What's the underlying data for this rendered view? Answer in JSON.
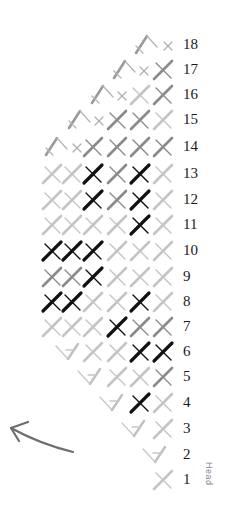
{
  "diagram": {
    "direction_arrow": "arrow-up-left",
    "side_label": "Head",
    "columns_x": [
      52,
      72,
      93,
      117,
      140,
      163
    ],
    "colors": {
      "d": "#111111",
      "m": "#8a8a8a",
      "l": "#c4c4c4",
      "x": "#b0b0b0"
    },
    "rows": [
      {
        "label": "18",
        "y": 45,
        "turn": {
          "type": "peak",
          "x": 147
        },
        "small_x": [
          168
        ],
        "cells": [
          null,
          null,
          null,
          null,
          null,
          null
        ]
      },
      {
        "label": "17",
        "y": 70,
        "turn": {
          "type": "peak",
          "x": 125
        },
        "small_x": [
          144
        ],
        "cells": [
          null,
          null,
          null,
          null,
          null,
          "m"
        ]
      },
      {
        "label": "16",
        "y": 95,
        "turn": {
          "type": "peak",
          "x": 103
        },
        "small_x": [
          122
        ],
        "cells": [
          null,
          null,
          null,
          null,
          "l",
          "m"
        ]
      },
      {
        "label": "15",
        "y": 120,
        "turn": {
          "type": "peak",
          "x": 80
        },
        "small_x": [
          99
        ],
        "cells": [
          null,
          null,
          null,
          "m",
          "m",
          "l"
        ]
      },
      {
        "label": "14",
        "y": 147,
        "turn": {
          "type": "peak",
          "x": 57
        },
        "small_x": [
          77
        ],
        "cells": [
          null,
          null,
          "m",
          "m",
          "m",
          "m"
        ]
      },
      {
        "label": "13",
        "y": 174,
        "turn": null,
        "small_x": [],
        "cells": [
          "l",
          "l",
          "d",
          "m",
          "d",
          "l"
        ]
      },
      {
        "label": "12",
        "y": 200,
        "turn": null,
        "small_x": [],
        "cells": [
          "l",
          "l",
          "d",
          "m",
          "d",
          "l"
        ]
      },
      {
        "label": "11",
        "y": 225,
        "turn": null,
        "small_x": [],
        "cells": [
          "l",
          "l",
          "l",
          "l",
          "d",
          "l"
        ]
      },
      {
        "label": "10",
        "y": 251,
        "turn": null,
        "small_x": [],
        "cells": [
          "d",
          "d",
          "d",
          "l",
          "l",
          "l"
        ]
      },
      {
        "label": "9",
        "y": 277,
        "turn": null,
        "small_x": [],
        "cells": [
          "m",
          "m",
          "d",
          "l",
          "l",
          "l"
        ]
      },
      {
        "label": "8",
        "y": 302,
        "turn": null,
        "small_x": [],
        "cells": [
          "d",
          "d",
          "l",
          "l",
          "d",
          "l"
        ]
      },
      {
        "label": "7",
        "y": 327,
        "turn": null,
        "small_x": [],
        "cells": [
          "l",
          "l",
          "l",
          "d",
          "m",
          "m"
        ]
      },
      {
        "label": "6",
        "y": 352,
        "turn": {
          "type": "valley",
          "x": 68
        },
        "small_x": [],
        "cells": [
          null,
          null,
          "l",
          "l",
          "d",
          "d"
        ]
      },
      {
        "label": "5",
        "y": 377,
        "turn": {
          "type": "valley",
          "x": 90
        },
        "small_x": [],
        "cells": [
          null,
          null,
          null,
          "l",
          "l",
          "m"
        ]
      },
      {
        "label": "4",
        "y": 403,
        "turn": {
          "type": "valley",
          "x": 112
        },
        "small_x": [],
        "cells": [
          null,
          null,
          null,
          null,
          "d",
          "l"
        ]
      },
      {
        "label": "3",
        "y": 429,
        "turn": {
          "type": "valley",
          "x": 134
        },
        "small_x": [],
        "cells": [
          null,
          null,
          null,
          null,
          null,
          "l"
        ]
      },
      {
        "label": "2",
        "y": 455,
        "turn": {
          "type": "valley",
          "x": 155
        },
        "small_x": [],
        "cells": [
          null,
          null,
          null,
          null,
          null,
          null
        ]
      },
      {
        "label": "1",
        "y": 480,
        "turn": null,
        "small_x": [],
        "cells": [
          null,
          null,
          null,
          null,
          null,
          "l"
        ]
      }
    ]
  }
}
